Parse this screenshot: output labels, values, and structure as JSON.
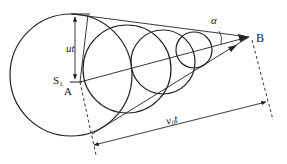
{
  "diagram": {
    "labels": {
      "ut": "ut",
      "s1": "S",
      "s1_sub": "1",
      "a": "A",
      "b": "B",
      "alpha": "α",
      "v0t": "v",
      "v0t_sub": "0",
      "v0t_t": "t"
    },
    "circles": [
      {
        "cx": 71,
        "cy": 75,
        "r": 61
      },
      {
        "cx": 127,
        "cy": 69,
        "r": 44
      },
      {
        "cx": 163,
        "cy": 62,
        "r": 32
      },
      {
        "cx": 194,
        "cy": 50,
        "r": 18
      }
    ],
    "stroke_color": "#222222"
  }
}
